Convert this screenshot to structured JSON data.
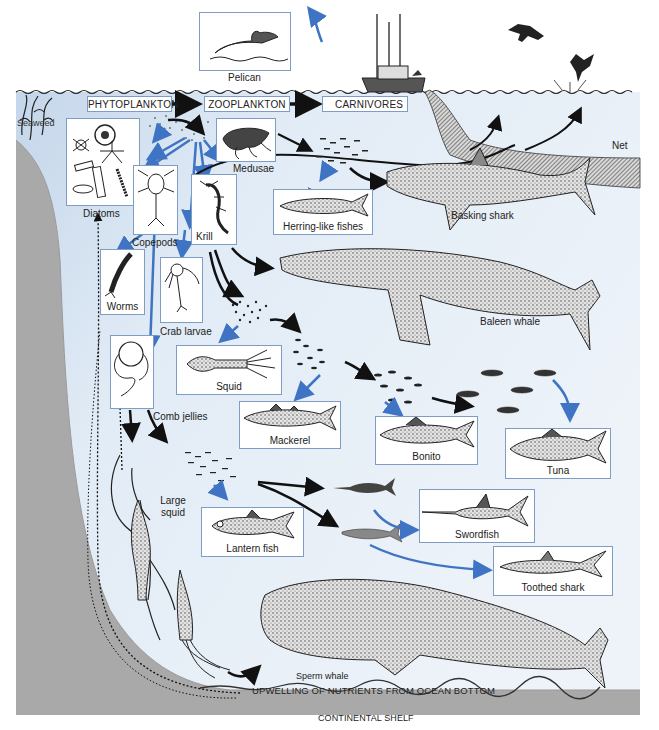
{
  "diagram": {
    "colors": {
      "water_light": "#e8f0f8",
      "water_surface": "#c9d9ea",
      "seafloor": "#a9a9a9",
      "box_border": "#7f9cc4",
      "arrow_blue": "#3f74c4",
      "arrow_black": "#111111",
      "net_hatch": "#555555"
    },
    "trophic_levels": [
      {
        "id": "phytoplankton",
        "label": "PHYTOPLANKTON"
      },
      {
        "id": "zooplankton",
        "label": "ZOOPLANKTON"
      },
      {
        "id": "carnivores",
        "label": "CARNIVORES"
      }
    ],
    "organisms": {
      "pelican": "Pelican",
      "seaweed": "Seaweed",
      "diatoms": "Diatoms",
      "medusae": "Medusae",
      "copepods": "Copepods",
      "krill": "Krill",
      "herring": "Herring-like fishes",
      "basking_shark": "Basking shark",
      "net": "Net",
      "worms": "Worms",
      "crab_larvae": "Crab larvae",
      "baleen_whale": "Baleen whale",
      "squid": "Squid",
      "comb_jellies": "Comb jellies",
      "mackerel": "Mackerel",
      "bonito": "Bonito",
      "tuna": "Tuna",
      "large_squid": "Large squid",
      "lantern_fish": "Lantern fish",
      "swordfish": "Swordfish",
      "toothed_shark": "Toothed shark",
      "sperm_whale": "Sperm whale"
    },
    "zones": {
      "upwelling": "UPWELLING OF NUTRIENTS FROM OCEAN  BOTTOM",
      "continental_shelf": "CONTINENTAL SHELF"
    },
    "links": [
      {
        "from": "PHYTOPLANKTON",
        "to": "ZOOPLANKTON",
        "style": "black"
      },
      {
        "from": "ZOOPLANKTON",
        "to": "CARNIVORES",
        "style": "black"
      },
      {
        "from": "Phytoplankton",
        "to": "Diatoms",
        "style": "blue"
      },
      {
        "from": "Phytoplankton",
        "to": "Copepods",
        "style": "blue"
      },
      {
        "from": "Phytoplankton",
        "to": "Krill",
        "style": "blue"
      },
      {
        "from": "Phytoplankton",
        "to": "Medusae",
        "style": "blue"
      },
      {
        "from": "Phytoplankton",
        "to": "Worms",
        "style": "blue"
      },
      {
        "from": "Phytoplankton",
        "to": "Crab larvae",
        "style": "blue"
      },
      {
        "from": "Phytoplankton",
        "to": "Comb jellies",
        "style": "blue"
      },
      {
        "from": "Medusae",
        "to": "Herring-like fishes",
        "style": "black"
      },
      {
        "from": "Herring-like fishes",
        "to": "Basking shark",
        "style": "black"
      },
      {
        "from": "Herring-like fishes",
        "to": "Net",
        "style": "black"
      },
      {
        "from": "Krill",
        "to": "Baleen whale",
        "style": "black"
      },
      {
        "from": "Krill",
        "to": "Squid",
        "style": "black"
      },
      {
        "from": "Squid school",
        "to": "Mackerel",
        "style": "blue"
      },
      {
        "from": "Mackerel school",
        "to": "Bonito",
        "style": "blue"
      },
      {
        "from": "Bonito school",
        "to": "Tuna",
        "style": "black"
      },
      {
        "from": "Tuna school",
        "to": "Tuna",
        "style": "blue"
      },
      {
        "from": "Comb jellies",
        "to": "Large squid",
        "style": "black"
      },
      {
        "from": "Lantern fish school",
        "to": "Lantern fish",
        "style": "blue"
      },
      {
        "from": "Lantern fish school",
        "to": "Swordfish",
        "style": "black"
      },
      {
        "from": "Lantern fish school",
        "to": "Toothed shark",
        "style": "black"
      },
      {
        "from": "Large squid",
        "to": "Sperm whale",
        "style": "black"
      },
      {
        "from": "Ocean bottom",
        "to": "Diatoms",
        "style": "dotted"
      },
      {
        "from": "Boat",
        "to": "Pelican",
        "style": "blue"
      }
    ]
  }
}
